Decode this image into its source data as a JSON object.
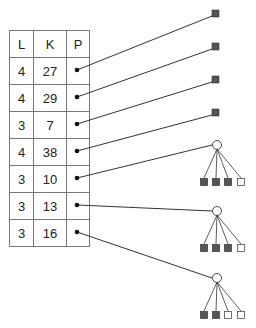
{
  "table": {
    "headers": [
      "L",
      "K",
      "P"
    ],
    "rows": [
      {
        "L": "4",
        "K": "27"
      },
      {
        "L": "4",
        "K": "29"
      },
      {
        "L": "3",
        "K": "7"
      },
      {
        "L": "4",
        "K": "38"
      },
      {
        "L": "3",
        "K": "10"
      },
      {
        "L": "3",
        "K": "13"
      },
      {
        "L": "3",
        "K": "16"
      }
    ]
  },
  "targets": {
    "leaves": [
      {
        "row": 0,
        "fill": "#555555"
      },
      {
        "row": 1,
        "fill": "#555555"
      },
      {
        "row": 2,
        "fill": "#555555"
      },
      {
        "row": 3,
        "fill": "#555555"
      }
    ],
    "subtrees": [
      {
        "row": 4,
        "children": [
          "filled",
          "filled",
          "filled",
          "empty"
        ]
      },
      {
        "row": 5,
        "children": [
          "filled",
          "filled",
          "filled",
          "empty"
        ]
      },
      {
        "row": 6,
        "children": [
          "filled",
          "filled",
          "empty",
          "empty"
        ]
      }
    ]
  },
  "colors": {
    "line": "#333333",
    "border": "#777777",
    "filled": "#555555",
    "empty": "#ffffff"
  }
}
